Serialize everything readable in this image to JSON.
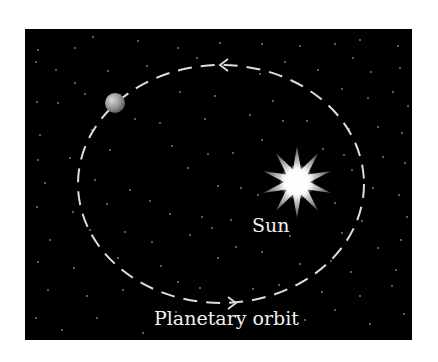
{
  "diagram": {
    "panel": {
      "x": 25,
      "y": 29,
      "width": 387,
      "height": 311,
      "fill": "#000000"
    },
    "orbit": {
      "cx": 221,
      "cy": 184,
      "rx": 143,
      "ry": 119,
      "stroke": "#dddddd",
      "dash": "14 9"
    },
    "planet": {
      "cx": 115,
      "cy": 103,
      "r": 10
    },
    "sun": {
      "cx": 297,
      "cy": 182,
      "outer_r": 36,
      "inner_r": 13,
      "points": 10
    },
    "arrows": [
      {
        "name": "top-arrow",
        "direction": "left",
        "x": 220,
        "y": 65
      },
      {
        "name": "bottom-arrow",
        "direction": "right",
        "x": 236,
        "y": 303
      }
    ],
    "labels": {
      "sun": "Sun",
      "orbit": "Planetary orbit"
    },
    "stars": [
      [
        38,
        50
      ],
      [
        75,
        48
      ],
      [
        93,
        37
      ],
      [
        138,
        41
      ],
      [
        178,
        48
      ],
      [
        220,
        43
      ],
      [
        262,
        44
      ],
      [
        300,
        46
      ],
      [
        335,
        44
      ],
      [
        360,
        40
      ],
      [
        398,
        46
      ],
      [
        36,
        62
      ],
      [
        56,
        70
      ],
      [
        75,
        83
      ],
      [
        108,
        71
      ],
      [
        147,
        66
      ],
      [
        197,
        58
      ],
      [
        260,
        74
      ],
      [
        285,
        62
      ],
      [
        318,
        70
      ],
      [
        353,
        58
      ],
      [
        371,
        72
      ],
      [
        400,
        68
      ],
      [
        37,
        102
      ],
      [
        58,
        103
      ],
      [
        85,
        94
      ],
      [
        120,
        95
      ],
      [
        180,
        92
      ],
      [
        215,
        96
      ],
      [
        273,
        101
      ],
      [
        342,
        89
      ],
      [
        368,
        98
      ],
      [
        393,
        92
      ],
      [
        408,
        106
      ],
      [
        40,
        135
      ],
      [
        92,
        130
      ],
      [
        135,
        119
      ],
      [
        160,
        123
      ],
      [
        205,
        119
      ],
      [
        250,
        115
      ],
      [
        283,
        121
      ],
      [
        307,
        121
      ],
      [
        349,
        129
      ],
      [
        378,
        127
      ],
      [
        402,
        133
      ],
      [
        38,
        160
      ],
      [
        70,
        158
      ],
      [
        110,
        150
      ],
      [
        172,
        146
      ],
      [
        208,
        154
      ],
      [
        233,
        153
      ],
      [
        262,
        140
      ],
      [
        323,
        149
      ],
      [
        344,
        155
      ],
      [
        383,
        157
      ],
      [
        405,
        163
      ],
      [
        45,
        183
      ],
      [
        95,
        180
      ],
      [
        130,
        190
      ],
      [
        188,
        168
      ],
      [
        218,
        186
      ],
      [
        241,
        188
      ],
      [
        258,
        195
      ],
      [
        352,
        170
      ],
      [
        373,
        188
      ],
      [
        399,
        195
      ],
      [
        37,
        207
      ],
      [
        73,
        212
      ],
      [
        107,
        204
      ],
      [
        150,
        201
      ],
      [
        170,
        214
      ],
      [
        202,
        217
      ],
      [
        231,
        220
      ],
      [
        335,
        203
      ],
      [
        362,
        221
      ],
      [
        407,
        217
      ],
      [
        50,
        240
      ],
      [
        90,
        230
      ],
      [
        125,
        232
      ],
      [
        152,
        242
      ],
      [
        190,
        235
      ],
      [
        212,
        228
      ],
      [
        236,
        247
      ],
      [
        290,
        236
      ],
      [
        342,
        233
      ],
      [
        378,
        248
      ],
      [
        401,
        240
      ],
      [
        38,
        262
      ],
      [
        74,
        268
      ],
      [
        118,
        258
      ],
      [
        161,
        266
      ],
      [
        218,
        258
      ],
      [
        262,
        252
      ],
      [
        300,
        264
      ],
      [
        331,
        261
      ],
      [
        351,
        272
      ],
      [
        396,
        270
      ],
      [
        48,
        290
      ],
      [
        87,
        296
      ],
      [
        123,
        290
      ],
      [
        178,
        282
      ],
      [
        200,
        288
      ],
      [
        253,
        289
      ],
      [
        279,
        285
      ],
      [
        322,
        292
      ],
      [
        360,
        296
      ],
      [
        392,
        286
      ],
      [
        36,
        318
      ],
      [
        62,
        330
      ],
      [
        97,
        318
      ],
      [
        143,
        333
      ],
      [
        176,
        312
      ],
      [
        305,
        320
      ],
      [
        335,
        310
      ],
      [
        370,
        324
      ],
      [
        404,
        314
      ]
    ]
  }
}
